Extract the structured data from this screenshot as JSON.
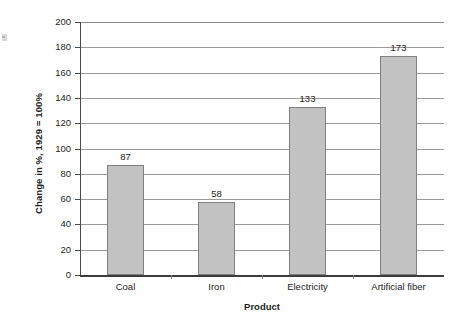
{
  "chart_data": {
    "type": "bar",
    "title": "",
    "categories": [
      "Coal",
      "Iron",
      "Electricity",
      "Artificial fiber"
    ],
    "values": [
      87,
      58,
      133,
      173
    ],
    "data_labels": [
      "87",
      "58",
      "133",
      "173"
    ],
    "xlabel": "Product",
    "ylabel": "Change in %, 1929 = 100%",
    "ylim": [
      0,
      200
    ],
    "ytick_labels": [
      "200",
      "180",
      "160",
      "140",
      "120",
      "100",
      "80",
      "60",
      "40",
      "20",
      "0"
    ],
    "ytick_values": [
      200,
      180,
      160,
      140,
      120,
      100,
      80,
      60,
      40,
      20,
      0
    ],
    "ytick_step": 20,
    "grid": true,
    "grid_axis": "y",
    "legend": false,
    "legend_position": "none",
    "bar_fill_color": "#c2c2c2",
    "bar_border_color": "#808080",
    "gridline_color": "#9a9a9a",
    "axis_color": "#3c3c3c",
    "text_color": "#1e1e1e"
  }
}
